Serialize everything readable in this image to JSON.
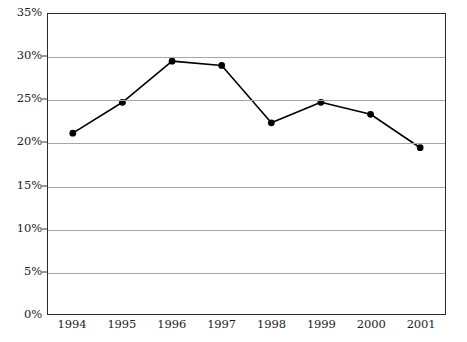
{
  "chart_data": {
    "type": "line",
    "title": "",
    "subtitle": "",
    "xlabel": "",
    "ylabel": "",
    "categories": [
      "1994",
      "1995",
      "1996",
      "1997",
      "1998",
      "1999",
      "2000",
      "2001"
    ],
    "series": [
      {
        "name": "",
        "values": [
          21.1,
          24.7,
          29.5,
          29.0,
          22.3,
          24.7,
          23.3,
          19.4
        ]
      }
    ],
    "ylim": [
      0,
      35
    ],
    "ytick_step": 5,
    "ytick_labels": [
      "0%",
      "5%",
      "10%",
      "15%",
      "20%",
      "25%",
      "30%",
      "35%"
    ],
    "ytick_values": [
      0,
      5,
      10,
      15,
      20,
      25,
      30,
      35
    ],
    "value_suffix": "%",
    "grid": {
      "horizontal": true,
      "vertical": false,
      "color": "#a6a6a6"
    },
    "legend": {
      "visible": false,
      "position": "none"
    },
    "style": {
      "line_color": "#000000",
      "line_width": 1.6,
      "marker": "circle",
      "marker_color": "#000000",
      "marker_radius": 3.4,
      "plot_border_color": "#2b2b2b",
      "background": "#ffffff",
      "text_color": "#1c1c1c"
    }
  }
}
